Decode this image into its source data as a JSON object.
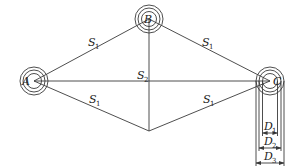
{
  "diagram": {
    "type": "geometric layout diagram",
    "nodes": [
      {
        "id": "A",
        "label": "A",
        "cx": 34,
        "cy": 81
      },
      {
        "id": "B",
        "label": "B",
        "cx": 149,
        "cy": 19
      },
      {
        "id": "C",
        "label": "C",
        "cx": 270,
        "cy": 81
      }
    ],
    "ring_radii": [
      7.5,
      11,
      14
    ],
    "bottom_vertex": {
      "x": 149,
      "y": 131
    },
    "edges": [
      {
        "from": "A",
        "to": "B",
        "label": "S",
        "sub": "1"
      },
      {
        "from": "B",
        "to": "C",
        "label": "S",
        "sub": "1"
      },
      {
        "from": "A",
        "to": "bottom",
        "label": "S",
        "sub": "1"
      },
      {
        "from": "bottom",
        "to": "C",
        "label": "S",
        "sub": "1"
      },
      {
        "from": "A",
        "to": "C",
        "label": "",
        "sub": ""
      },
      {
        "from": "B",
        "to": "bottom",
        "label": "S",
        "sub": "2"
      }
    ],
    "labels": {
      "a": "A",
      "b": "B",
      "c": "C",
      "s1_ab": {
        "main": "S",
        "sub": "1"
      },
      "s1_bc": {
        "main": "S",
        "sub": "1"
      },
      "s1_ad": {
        "main": "S",
        "sub": "1"
      },
      "s1_dc": {
        "main": "S",
        "sub": "1"
      },
      "s2": {
        "main": "S",
        "sub": "2"
      },
      "d1": {
        "main": "D",
        "sub": "1"
      },
      "d2": {
        "main": "D",
        "sub": "2"
      },
      "d3": {
        "main": "D",
        "sub": "3"
      }
    },
    "dimensions": [
      {
        "label": "D1",
        "diameter_of": "inner ring",
        "y": 133
      },
      {
        "label": "D2",
        "diameter_of": "middle ring",
        "y": 148
      },
      {
        "label": "D3",
        "diameter_of": "outer ring",
        "y": 163
      }
    ]
  }
}
